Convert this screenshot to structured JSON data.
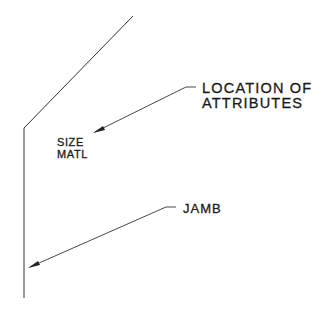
{
  "diagram": {
    "type": "drafting-detail",
    "line_color": "#333333",
    "text_color": "#1a1a1a",
    "background": "#ffffff"
  },
  "labels": {
    "location_line1": "LOCATION OF",
    "location_line2": "ATTRIBUTES",
    "size": "SIZE",
    "matl": "MATL",
    "jamb": "JAMB"
  }
}
